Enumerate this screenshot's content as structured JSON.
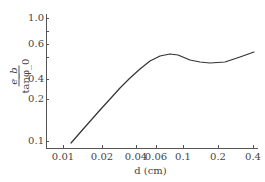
{
  "chart_data": {
    "type": "line",
    "title": "",
    "xlabel": "d (cm)",
    "ylabel": "e_b / tan φ_0",
    "ylabel_parts": {
      "numerator": "e_b",
      "denominator": "tanφ_0"
    },
    "xscale": "log",
    "yscale": "log",
    "xlim": [
      0.0085,
      0.42
    ],
    "ylim": [
      0.08,
      1.0
    ],
    "grid": false,
    "legend": null,
    "x_ticks": [
      {
        "label": "0.01",
        "value": 0.01,
        "px": 63
      },
      {
        "label": "0.02",
        "value": 0.02,
        "px": 102
      },
      {
        "label": "0.04",
        "value": 0.04,
        "px": 136
      },
      {
        "label": "0.06",
        "value": 0.06,
        "px": 156
      },
      {
        "label": "0.1",
        "value": 0.1,
        "px": 183
      },
      {
        "label": "0.2",
        "value": 0.2,
        "px": 218
      },
      {
        "label": "0.4",
        "value": 0.4,
        "px": 253
      }
    ],
    "y_ticks": [
      {
        "label": "1.0",
        "value": 1.0,
        "py": 18
      },
      {
        "label": "",
        "value": 0.8,
        "py": 31
      },
      {
        "label": "0.6",
        "value": 0.6,
        "py": 44
      },
      {
        "label": "",
        "value": 0.5,
        "py": 57
      },
      {
        "label": "0.4",
        "value": 0.4,
        "py": 79
      },
      {
        "label": "0.2",
        "value": 0.2,
        "py": 99
      },
      {
        "label": "0.1",
        "value": 0.1,
        "py": 141
      }
    ],
    "series": [
      {
        "name": "e_b/tanφ_0 vs d",
        "x": [
          0.0117,
          0.015,
          0.02,
          0.025,
          0.03,
          0.037,
          0.044,
          0.055,
          0.065,
          0.078,
          0.09,
          0.114,
          0.14,
          0.168,
          0.22,
          0.3,
          0.39
        ],
        "y": [
          0.09,
          0.12,
          0.17,
          0.23,
          0.3,
          0.38,
          0.46,
          0.51,
          0.53,
          0.54,
          0.53,
          0.51,
          0.495,
          0.49,
          0.5,
          0.525,
          0.55
        ],
        "px_points": [
          [
            71,
            143
          ],
          [
            85,
            127
          ],
          [
            100,
            110
          ],
          [
            111,
            98
          ],
          [
            120,
            88
          ],
          [
            130,
            78
          ],
          [
            140,
            69
          ],
          [
            150,
            61
          ],
          [
            160,
            56
          ],
          [
            170,
            54
          ],
          [
            178,
            55
          ],
          [
            190,
            60
          ],
          [
            200,
            62
          ],
          [
            210,
            63
          ],
          [
            225,
            62
          ],
          [
            240,
            57
          ],
          [
            254,
            52
          ]
        ]
      }
    ],
    "plot_area_px": {
      "x0": 46,
      "y0": 148,
      "x1": 258,
      "y1": 14
    }
  }
}
